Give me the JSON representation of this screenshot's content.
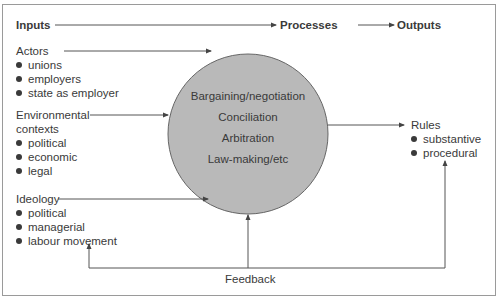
{
  "headers": {
    "inputs": "Inputs",
    "processes": "Processes",
    "outputs": "Outputs"
  },
  "inputs": {
    "actors": {
      "label": "Actors",
      "items": [
        "unions",
        "employers",
        "state as employer"
      ]
    },
    "environmental": {
      "label_line1": "Environmental",
      "label_line2": "contexts",
      "items": [
        "political",
        "economic",
        "legal"
      ]
    },
    "ideology": {
      "label": "Ideology",
      "items": [
        "political",
        "managerial",
        "labour movement"
      ]
    }
  },
  "processes": {
    "items": [
      "Bargaining/negotiation",
      "Conciliation",
      "Arbitration",
      "Law-making/etc"
    ]
  },
  "outputs": {
    "label": "Rules",
    "items": [
      "substantive",
      "procedural"
    ]
  },
  "feedback": {
    "label": "Feedback"
  },
  "colors": {
    "circle_fill": "#b9b9b9",
    "line": "#555555",
    "text": "#3a3a3a"
  }
}
